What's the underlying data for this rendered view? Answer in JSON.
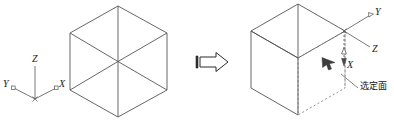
{
  "figure": {
    "background_color": "#ffffff",
    "stroke_color": "#555555",
    "dash_color": "#8a8a8a",
    "text_color": "#1a1a1a",
    "arrow_fill": "#ffffff",
    "cursor_color": "#3d3d3d"
  },
  "left_panel": {
    "name": "original-isometric-cube",
    "axis_triad": {
      "name": "world-axis-triad",
      "labels": {
        "z": "Z",
        "y": "Y",
        "x": "X"
      }
    },
    "cube": {
      "name": "isometric-cube-hexagon",
      "faces": [
        "top",
        "left",
        "right"
      ],
      "style": "solid"
    }
  },
  "transition": {
    "name": "transition-block-arrow",
    "direction": "right",
    "glyph": "block-arrow-right"
  },
  "right_panel": {
    "name": "cube-with-selected-face",
    "axis_triad": {
      "name": "rotated-axis-triad",
      "labels": {
        "y": "Y",
        "z": "Z",
        "x": "X"
      }
    },
    "cube": {
      "name": "isometric-cube-hexagon",
      "faces": [
        "top",
        "left",
        "right"
      ],
      "selected_face": "right",
      "selected_face_style": "dashed"
    },
    "annotation": {
      "name": "selected-face-callout",
      "label": "选定面",
      "leader_line": true
    },
    "cursor": {
      "name": "mouse-cursor-arrow",
      "visible": true
    }
  }
}
